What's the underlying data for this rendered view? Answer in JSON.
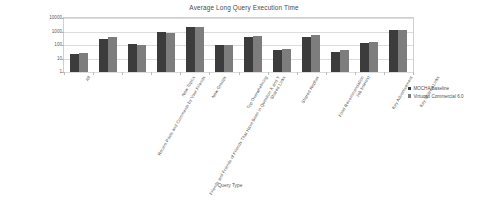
{
  "chart_data": {
    "type": "bar",
    "title": "Average Long Query Execution Time",
    "xlabel": "Query Type",
    "ylabel": "Time (in ms)",
    "yscale": "log",
    "ylim": [
      1,
      10000
    ],
    "ytick_labels": [
      "1",
      "10",
      "100",
      "1000",
      "10000"
    ],
    "ytick_values": [
      1,
      10,
      100,
      1000,
      10000
    ],
    "grid": true,
    "legend_position": "right",
    "categories": [
      "All",
      "Recent Posts and Comments by Your Friends",
      "Friends and Friends of Friends That Have Been in Question X and Y",
      "New Topics",
      "New Groups",
      "Top Overwhelming",
      "Shared Links",
      "Shared Replies",
      "Food Recommendation",
      "Job Interest",
      "Key Advertisement",
      "Key Shared Links"
    ],
    "series": [
      {
        "name": "MOCHA Baseline",
        "color": "#3c3c3c",
        "values": [
          22,
          300,
          120,
          1000,
          2200,
          95,
          420,
          40,
          400,
          30,
          130,
          1300
        ]
      },
      {
        "name": "Virtuoso Commercial 6.0",
        "color": "#7d7d7d",
        "values": [
          24,
          390,
          100,
          740,
          2300,
          105,
          450,
          52,
          520,
          42,
          180,
          1350
        ]
      }
    ]
  },
  "legend": {
    "items": [
      {
        "label": "MOCHA Baseline"
      },
      {
        "label": "Virtuoso Commercial 6.0"
      }
    ]
  }
}
